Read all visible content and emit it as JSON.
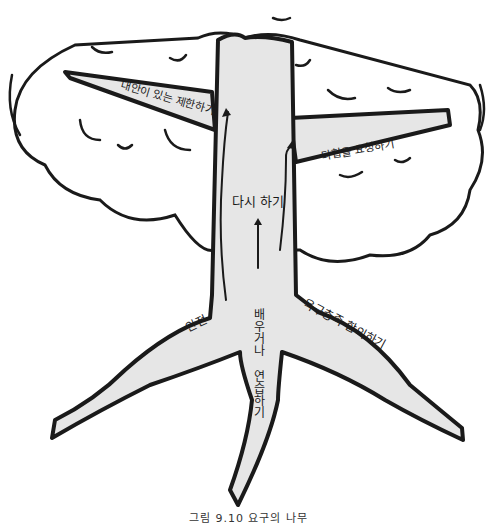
{
  "diagram": {
    "type": "tree-metaphor",
    "colors": {
      "fill": "#e6e6e6",
      "stroke": "#1a1a1a",
      "background": "#ffffff"
    },
    "trunk": {
      "label": "다시 하기"
    },
    "branches": [
      {
        "id": "left",
        "label": "대안이 있는 제한하기"
      },
      {
        "id": "right",
        "label": "타협을 요청하기"
      }
    ],
    "roots": [
      {
        "id": "left",
        "label": "안전"
      },
      {
        "id": "middle",
        "label": "배우거나 연습하기"
      },
      {
        "id": "right",
        "label": "욕구충족 합의하기"
      }
    ],
    "caption": "그림 9.10 요구의 나무"
  }
}
